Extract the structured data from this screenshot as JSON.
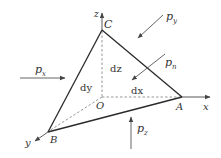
{
  "diagram": {
    "type": "tetrahedron-stress-element",
    "colors": {
      "edge": "#2a2a2a",
      "dashed": "#8a8a8a",
      "arrow": "#555555",
      "text": "#333333"
    },
    "points": {
      "C": "C",
      "O": "O",
      "A": "A",
      "B": "B"
    },
    "axes": {
      "x": "x",
      "y": "y",
      "z": "z"
    },
    "differentials": {
      "dx": "dx",
      "dy": "dy",
      "dz": "dz"
    },
    "loads": [
      {
        "name": "p_x",
        "base": "p",
        "subscript": "x"
      },
      {
        "name": "p_y",
        "base": "p",
        "subscript": "y"
      },
      {
        "name": "p_z",
        "base": "p",
        "subscript": "z"
      },
      {
        "name": "p_n",
        "base": "p",
        "subscript": "n"
      }
    ]
  }
}
